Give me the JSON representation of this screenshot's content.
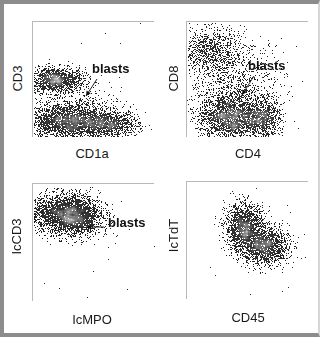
{
  "figure": {
    "background": "#ffffff",
    "frame_color": "#8c8c8c"
  },
  "chart_data": [
    {
      "type": "scatter",
      "id": "p1",
      "xlabel": "CD1a",
      "ylabel": "CD3",
      "annotation": "blasts",
      "box": {
        "left": 32,
        "top": 21,
        "width": 122,
        "height": 116
      },
      "xlabel_pos": {
        "left": 60,
        "top": 146,
        "width": 64
      },
      "ylabel_pos": {
        "left": -8,
        "top": 71,
        "width": 50
      },
      "annot_pos": {
        "left": 92,
        "top": 61
      },
      "arrow": {
        "x1": 97,
        "y1": 79,
        "x2": 86,
        "y2": 96
      },
      "axis_range": {
        "x": [
          0,
          1
        ],
        "y": [
          0,
          1
        ]
      },
      "grid": false,
      "clusters": [
        {
          "cx": 0.18,
          "cy": 0.5,
          "sx": 0.12,
          "sy": 0.055,
          "n": 1500
        },
        {
          "cx": 0.28,
          "cy": 0.15,
          "sx": 0.16,
          "sy": 0.08,
          "n": 2600
        },
        {
          "cx": 0.62,
          "cy": 0.12,
          "sx": 0.12,
          "sy": 0.06,
          "n": 1200
        },
        {
          "cx": 0.45,
          "cy": 0.3,
          "sx": 0.14,
          "sy": 0.08,
          "n": 150
        }
      ]
    },
    {
      "type": "scatter",
      "id": "p2",
      "xlabel": "CD4",
      "ylabel": "CD8",
      "annotation": "blasts",
      "box": {
        "left": 186,
        "top": 21,
        "width": 122,
        "height": 116
      },
      "xlabel_pos": {
        "left": 218,
        "top": 146,
        "width": 60
      },
      "ylabel_pos": {
        "left": 148,
        "top": 71,
        "width": 50
      },
      "annot_pos": {
        "left": 248,
        "top": 58
      },
      "arrow": {
        "x1": 254,
        "y1": 76,
        "x2": 242,
        "y2": 95
      },
      "axis_range": {
        "x": [
          0,
          1
        ],
        "y": [
          0,
          1
        ]
      },
      "grid": false,
      "clusters": [
        {
          "cx": 0.17,
          "cy": 0.76,
          "sx": 0.13,
          "sy": 0.1,
          "n": 900
        },
        {
          "cx": 0.35,
          "cy": 0.18,
          "sx": 0.13,
          "sy": 0.1,
          "n": 2200
        },
        {
          "cx": 0.62,
          "cy": 0.17,
          "sx": 0.07,
          "sy": 0.1,
          "n": 900
        },
        {
          "cx": 0.4,
          "cy": 0.5,
          "sx": 0.2,
          "sy": 0.17,
          "n": 900
        }
      ]
    },
    {
      "type": "scatter",
      "id": "p3",
      "xlabel": "IcMPO",
      "ylabel": "IcCD3",
      "annotation": "blasts",
      "box": {
        "left": 32,
        "top": 183,
        "width": 122,
        "height": 118
      },
      "xlabel_pos": {
        "left": 60,
        "top": 312,
        "width": 64
      },
      "ylabel_pos": {
        "left": -12,
        "top": 229,
        "width": 56
      },
      "annot_pos": {
        "left": 108,
        "top": 215
      },
      "arrow": {
        "x1": 104,
        "y1": 227,
        "x2": 86,
        "y2": 227
      },
      "axis_range": {
        "x": [
          0,
          1
        ],
        "y": [
          0,
          1
        ]
      },
      "grid": false,
      "clusters": [
        {
          "cx": 0.26,
          "cy": 0.76,
          "sx": 0.14,
          "sy": 0.08,
          "n": 2800
        },
        {
          "cx": 0.36,
          "cy": 0.68,
          "sx": 0.1,
          "sy": 0.07,
          "n": 800
        }
      ]
    },
    {
      "type": "scatter",
      "id": "p4",
      "xlabel": "CD45",
      "ylabel": "IcTdT",
      "annotation": "",
      "box": {
        "left": 186,
        "top": 181,
        "width": 122,
        "height": 118
      },
      "xlabel_pos": {
        "left": 218,
        "top": 310,
        "width": 60
      },
      "ylabel_pos": {
        "left": 148,
        "top": 228,
        "width": 50
      },
      "axis_range": {
        "x": [
          0,
          1
        ],
        "y": [
          0,
          1
        ]
      },
      "grid": false,
      "clusters": [
        {
          "cx": 0.47,
          "cy": 0.62,
          "sx": 0.08,
          "sy": 0.1,
          "n": 1600
        },
        {
          "cx": 0.63,
          "cy": 0.46,
          "sx": 0.1,
          "sy": 0.08,
          "n": 1600
        }
      ]
    }
  ]
}
